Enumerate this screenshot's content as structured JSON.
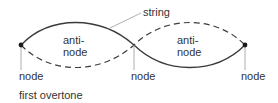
{
  "diagram": {
    "caption": "first overtone",
    "string_label": "string",
    "antinodes": [
      {
        "line1": "anti-",
        "line2": "node"
      },
      {
        "line1": "anti-",
        "line2": "node"
      }
    ],
    "nodes": [
      {
        "label": "node"
      },
      {
        "label": "node"
      },
      {
        "label": "node"
      }
    ],
    "colors": {
      "curve": "#3a3a3a",
      "leader": "#9a9a9a",
      "text": "#333333",
      "node_dot": "#1a1a1a"
    }
  }
}
